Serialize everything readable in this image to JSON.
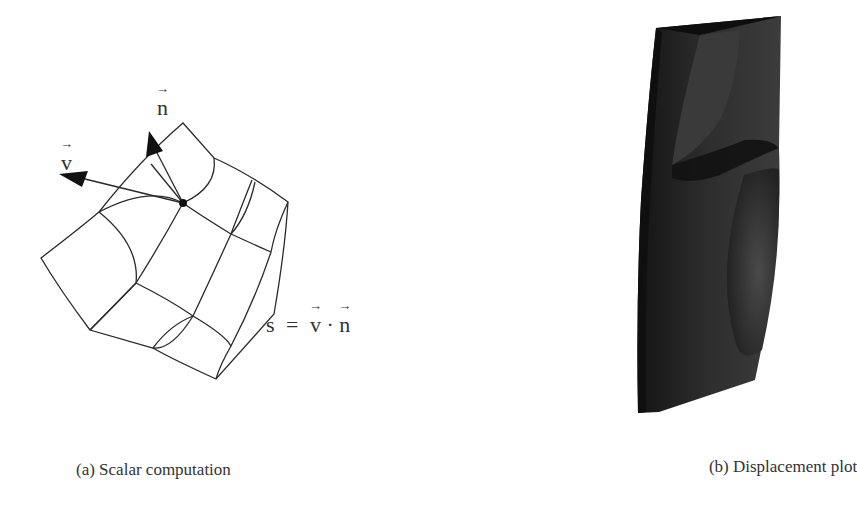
{
  "figure": {
    "panel_a": {
      "caption": "(a) Scalar computation",
      "labels": {
        "v": "v",
        "n": "n",
        "arrow_glyph": "→"
      },
      "equation": {
        "lhs": "s",
        "equals": "=",
        "v": "v",
        "dot": "·",
        "n": "n"
      }
    },
    "panel_b": {
      "caption": "(b) Displacement plot"
    },
    "colors": {
      "line": "#2a2a2a",
      "solid_dark": "#1c1c1c",
      "solid_mid": "#3a3a3a",
      "background": "#ffffff"
    }
  }
}
